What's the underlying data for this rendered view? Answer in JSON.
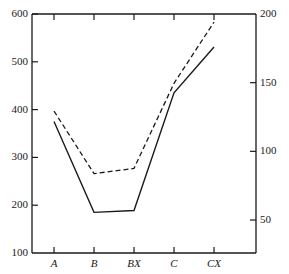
{
  "chart_data": {
    "type": "line",
    "title": "",
    "subtitle": "",
    "xlabel": "",
    "ylabel": "",
    "y2label": "",
    "grid": false,
    "legend": "none",
    "categories": [
      "A",
      "B",
      "BX",
      "C",
      "CX"
    ],
    "ylim": [
      100,
      600
    ],
    "yticks": [
      100,
      200,
      300,
      400,
      500,
      600
    ],
    "ytick_labels": [
      "100",
      "200",
      "300",
      "400",
      "500",
      "600"
    ],
    "y2lim": [
      26,
      200
    ],
    "y2ticks": [
      50,
      100,
      150,
      200
    ],
    "y2tick_labels": [
      "50",
      "100",
      "150",
      "200"
    ],
    "series": [
      {
        "name": "dashed-series",
        "style": "dashed",
        "axis": "left",
        "color": "#1a1a1a",
        "values": [
          397,
          266,
          277,
          455,
          583
        ]
      },
      {
        "name": "solid-series",
        "style": "solid",
        "axis": "left",
        "color": "#1a1a1a",
        "values": [
          375,
          185,
          189,
          435,
          531
        ]
      }
    ]
  },
  "axes": {
    "left_ticks": [
      {
        "label": "600",
        "value": 600
      },
      {
        "label": "500",
        "value": 500
      },
      {
        "label": "400",
        "value": 400
      },
      {
        "label": "300",
        "value": 300
      },
      {
        "label": "200",
        "value": 200
      },
      {
        "label": "100",
        "value": 100
      }
    ],
    "right_ticks": [
      {
        "label": "200",
        "value": 200
      },
      {
        "label": "150",
        "value": 150
      },
      {
        "label": "100",
        "value": 100
      },
      {
        "label": "50",
        "value": 50
      }
    ],
    "x_ticks": [
      {
        "label": "A"
      },
      {
        "label": "B"
      },
      {
        "label": "BX"
      },
      {
        "label": "C"
      },
      {
        "label": "CX"
      }
    ]
  }
}
